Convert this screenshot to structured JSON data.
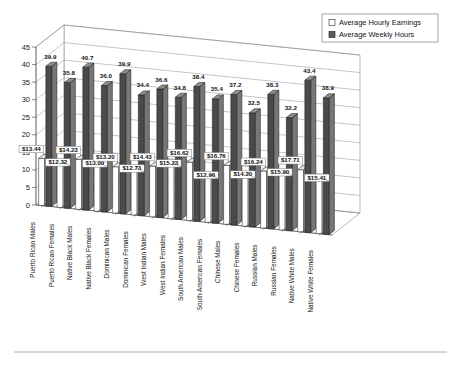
{
  "chart_data": {
    "type": "bar",
    "title": "",
    "subtitle": "",
    "xlabel": "",
    "ylabel": "",
    "ylim": [
      0,
      45
    ],
    "yticks": [
      0,
      5,
      10,
      15,
      20,
      25,
      30,
      35,
      40,
      45
    ],
    "grid": true,
    "legend_position": "top-right",
    "style": "3d-clustered-column",
    "categories": [
      "Puerto Rican Males",
      "Puerto Rican Females",
      "Native Black Males",
      "Native Black Females",
      "Dominican Males",
      "Dominican Females",
      "West Indian Males",
      "West Indian Females",
      "South American Males",
      "South American Females",
      "Chinese Males",
      "Chinese Females",
      "Russian Males",
      "Russian Females",
      "Native White Males",
      "Native White Females"
    ],
    "series": [
      {
        "name": "Average Hourly Earnings",
        "values": [
          13.44,
          12.32,
          14.23,
          13.09,
          13.2,
          12.73,
          14.43,
          15.23,
          16.62,
          12.96,
          16.76,
          14.2,
          16.24,
          15.9,
          17.71,
          15.41
        ],
        "labels": [
          "$13.44",
          "$12.32",
          "$14.23",
          "$13.09",
          "$13.20",
          "$12.73",
          "$14.43",
          "$15.23",
          "$16.62",
          "$12.96",
          "$16.76",
          "$14.20",
          "$16.24",
          "$15.90",
          "$17.71",
          "$15.41"
        ],
        "color": "#ffffff"
      },
      {
        "name": "Average Weekly Hours",
        "values": [
          39.9,
          35.8,
          40.7,
          36.0,
          39.9,
          34.4,
          36.6,
          34.8,
          38.4,
          35.4,
          37.2,
          32.5,
          38.3,
          32.2,
          43.4,
          38.9
        ],
        "labels": [
          "39.9",
          "35.8",
          "40.7",
          "36.0",
          "39.9",
          "34.4",
          "36.6",
          "34.8",
          "38.4",
          "35.4",
          "37.2",
          "32.5",
          "38.3",
          "32.2",
          "43.4",
          "38.9"
        ],
        "color": "#4a4a4a"
      }
    ]
  },
  "legend": {
    "items": [
      {
        "label": "Average Hourly Earnings",
        "swatch": "hollow-square-icon"
      },
      {
        "label": "Average Weekly Hours",
        "swatch": "filled-square-icon"
      }
    ]
  }
}
